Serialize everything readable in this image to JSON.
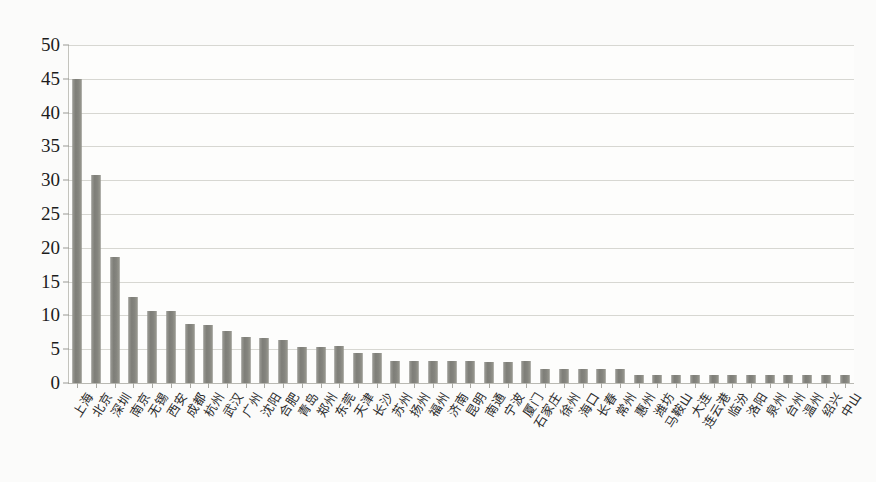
{
  "chart_data": {
    "type": "bar",
    "title": "",
    "subtitle": "",
    "xlabel": "",
    "ylabel": "",
    "ylim": [
      0,
      50
    ],
    "yticks": [
      0,
      5,
      10,
      15,
      20,
      25,
      30,
      35,
      40,
      45,
      50
    ],
    "grid": true,
    "legend": null,
    "legend_position": "none",
    "bar_color": "#8a8a85",
    "background_color": "#fbfbfa",
    "categories": [
      "上海",
      "北京",
      "深圳",
      "南京",
      "无锡",
      "西安",
      "成都",
      "杭州",
      "武汉",
      "广州",
      "沈阳",
      "合肥",
      "青岛",
      "郑州",
      "东莞",
      "天津",
      "长沙",
      "苏州",
      "扬州",
      "福州",
      "济南",
      "昆明",
      "南通",
      "宁波",
      "厦门",
      "石家庄",
      "徐州",
      "海口",
      "长春",
      "常州",
      "惠州",
      "潍坊",
      "马鞍山",
      "大连",
      "连云港",
      "临汾",
      "洛阳",
      "泉州",
      "台州",
      "温州",
      "绍兴",
      "中山"
    ],
    "values": [
      45.0,
      30.8,
      18.7,
      12.7,
      10.7,
      10.7,
      8.7,
      8.6,
      7.7,
      6.8,
      6.6,
      6.4,
      5.4,
      5.4,
      5.5,
      4.5,
      4.4,
      3.3,
      3.2,
      3.2,
      3.2,
      3.2,
      3.1,
      3.1,
      3.2,
      2.0,
      2.1,
      2.1,
      2.1,
      2.1,
      1.2,
      1.2,
      1.2,
      1.2,
      1.2,
      1.2,
      1.2,
      1.2,
      1.2,
      1.2,
      1.2,
      1.2
    ]
  },
  "axes": {
    "y_tick_labels": [
      "0",
      "5",
      "10",
      "15",
      "20",
      "25",
      "30",
      "35",
      "40",
      "45",
      "50"
    ]
  }
}
